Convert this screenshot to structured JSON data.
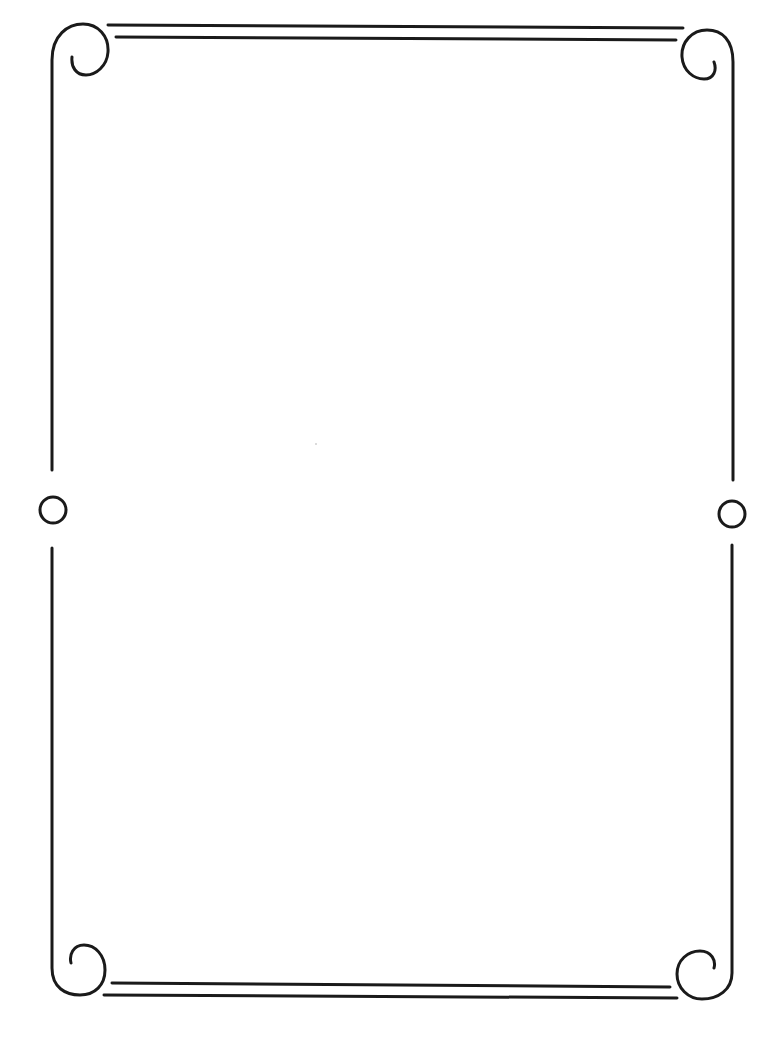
{
  "page": {
    "type": "decorative-border-frame",
    "background_color": "#ffffff",
    "stroke_color": "#1a1a1a",
    "content_text": ""
  },
  "frame": {
    "corners": [
      {
        "position": "top-left",
        "ornament": "scroll-curl"
      },
      {
        "position": "top-right",
        "ornament": "scroll-curl"
      },
      {
        "position": "bottom-left",
        "ornament": "scroll-curl"
      },
      {
        "position": "bottom-right",
        "ornament": "scroll-curl"
      }
    ],
    "side_ornaments": [
      {
        "position": "left-middle",
        "ornament": "circle"
      },
      {
        "position": "right-middle",
        "ornament": "circle"
      }
    ],
    "top_rule": "double-line",
    "bottom_rule": "double-line"
  }
}
